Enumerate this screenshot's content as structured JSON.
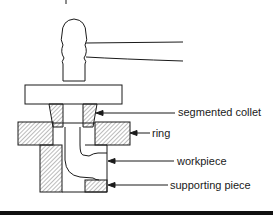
{
  "diagram": {
    "type": "mechanical cross-section",
    "components": [
      "hammer",
      "pressure plate",
      "segmented collet",
      "ring",
      "workpiece",
      "supporting piece",
      "die body"
    ]
  },
  "labels": {
    "segmented_collet": "segmented collet",
    "ring": "ring",
    "workpiece": "workpiece",
    "supporting_piece": "supporting piece"
  },
  "colors": {
    "line": "#1a1a1a",
    "background": "#ffffff",
    "bottom_bar": "#111111"
  }
}
